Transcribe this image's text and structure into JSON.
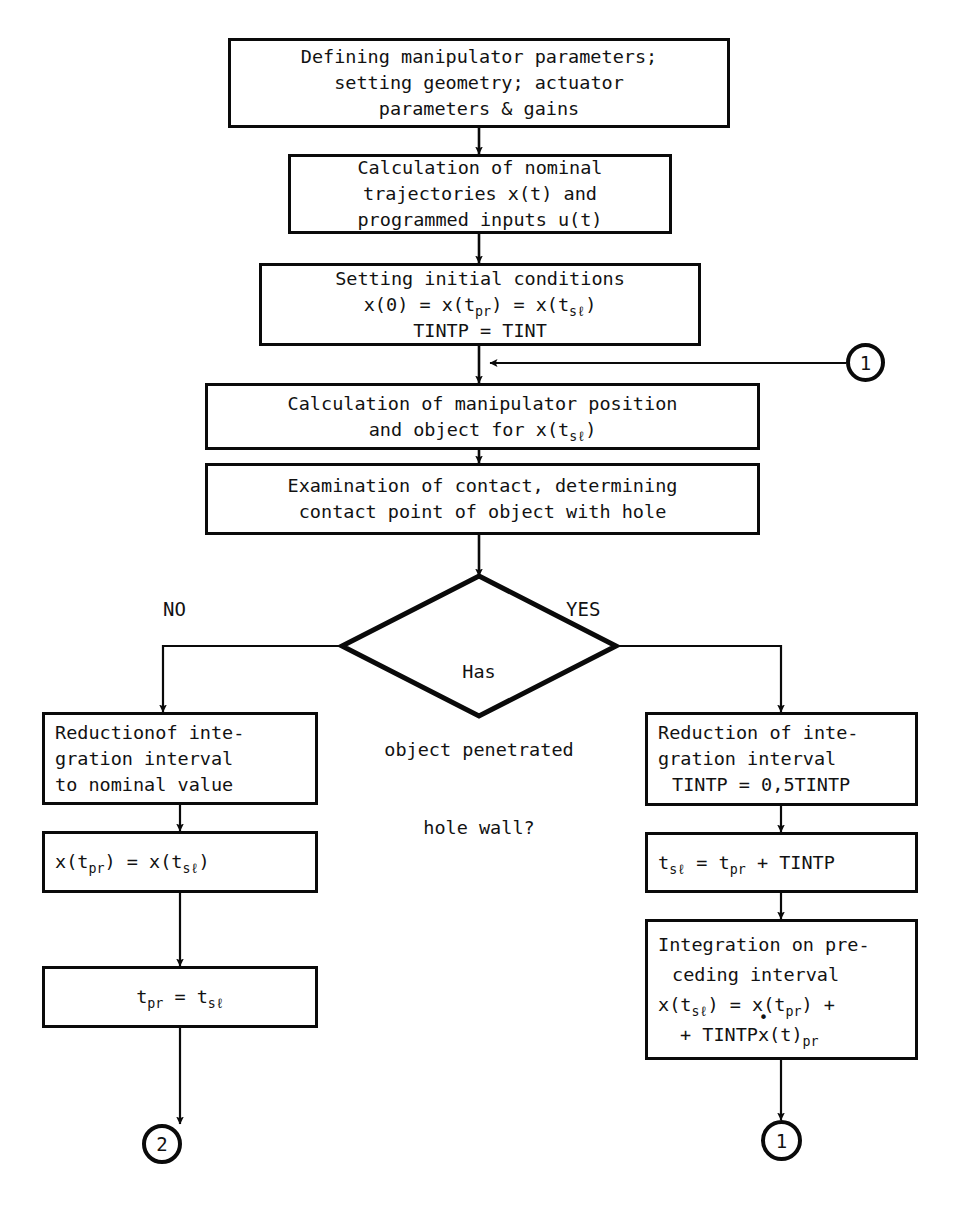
{
  "diagram": {
    "line_color": "#0a0a0a",
    "text_color": "#121212",
    "background": "#ffffff"
  },
  "nodes": {
    "define_params": {
      "l1": "Defining manipulator parameters;",
      "l2": "setting geometry; actuator",
      "l3": "parameters & gains"
    },
    "nominal_traj": {
      "l1": "Calculation of nominal",
      "l2": "trajectories x(t) and",
      "l3": "programmed inputs u(t)"
    },
    "initial_cond": {
      "l1": "Setting initial conditions",
      "eq_pre": "x(0) = x(t",
      "eq_sub1": "pr",
      "eq_mid": ") = x(t",
      "eq_sub2": "sℓ",
      "eq_post": ")",
      "l3": "TINTP = TINT"
    },
    "manip_position": {
      "l1": "Calculation of manipulator position",
      "l2_pre": "and object for x(t",
      "l2_sub": "sℓ",
      "l2_post": ")"
    },
    "examine_contact": {
      "l1": "Examination of contact, determining",
      "l2": "contact point of object with hole"
    },
    "decision": {
      "l1": "Has",
      "l2": "object penetrated",
      "l3": "hole wall?",
      "label_no": "NO",
      "label_yes": "YES"
    },
    "no_reduce": {
      "l1": "Reductionof inte-",
      "l2": "gration interval",
      "l3": "to nominal value"
    },
    "no_assign_x": {
      "pre": "x(t",
      "sub1": "pr",
      "mid": ") = x(t",
      "sub2": "sℓ",
      "post": ")"
    },
    "no_assign_t": {
      "pre": "t",
      "sub1": "pr",
      "mid": " = t",
      "sub2": "sℓ",
      "post": ""
    },
    "yes_reduce": {
      "l1": "Reduction of inte-",
      "l2": "gration interval",
      "l3": "TINTP = 0,5TINTP"
    },
    "yes_tsl": {
      "pre": "t",
      "sub1": "sℓ",
      "mid": " = t",
      "sub2": "pr",
      "post": " + TINTP"
    },
    "yes_integration": {
      "l1": "Integration on pre-",
      "l2": "ceding interval",
      "eq1_pre": "x(t",
      "eq1_sub1": "sℓ",
      "eq1_mid": ") = x(t",
      "eq1_sub2": "pr",
      "eq1_post": ") +",
      "eq2_pre": "+ TINTP",
      "eq2_dot": "x",
      "eq2_mid": "(t)",
      "eq2_sub": "pr"
    }
  },
  "connectors": {
    "top_right_one": "1",
    "bottom_left_two": "2",
    "bottom_right_one": "1"
  }
}
